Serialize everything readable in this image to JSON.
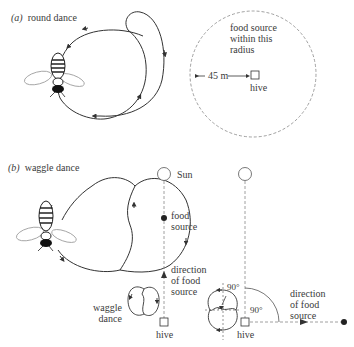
{
  "panel_a": {
    "tag": "(a)",
    "title": "round dance",
    "food_label": "food source\nwithin this\nradius",
    "distance_label": "45 m",
    "hive_label": "hive"
  },
  "panel_b": {
    "tag": "(b)",
    "title": "waggle dance",
    "sun_label": "Sun",
    "food_label": "food\nsource",
    "direction_label_1": "direction\nof food\nsource",
    "waggle_label": "waggle\ndance",
    "hive_label_1": "hive",
    "angle_label_small": "90°",
    "angle_label_large": "90°",
    "hive_label_2": "hive",
    "direction_label_2": "direction\nof food\nsource"
  },
  "colors": {
    "line": "#333333",
    "dashed": "#888888",
    "text": "#3a3a3a"
  }
}
